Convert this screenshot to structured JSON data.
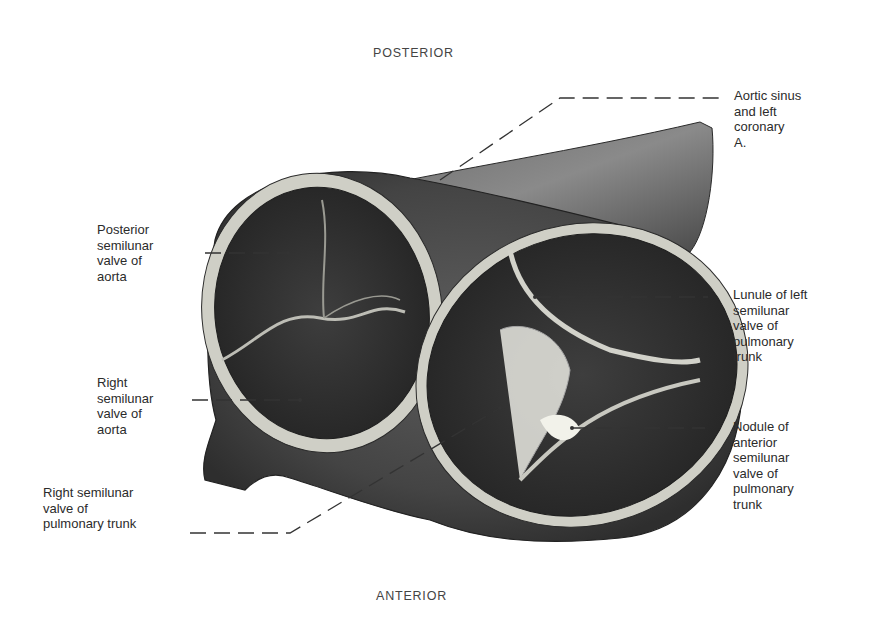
{
  "orientation": {
    "top": "POSTERIOR",
    "bottom": "ANTERIOR"
  },
  "labels": {
    "aortic_sinus": "Aortic sinus\nand left\ncoronary\nA.",
    "posterior_semilunar_aorta": "Posterior\nsemilunar\nvalve of\naorta",
    "right_semilunar_aorta": "Right\nsemilunar\nvalve of\naorta",
    "right_semilunar_pulmonary": "Right semilunar\nvalve of\npulmonary trunk",
    "lunule_left_semilunar_pulmonary": "Lunule of left\nsemilunar\nvalve of\npulmonary\ntrunk",
    "nodule_anterior_semilunar_pulmonary": "Nodule of\nanterior\nsemilunar\nvalve of\npulmonary\ntrunk"
  },
  "colors": {
    "tissue_dark": "#3a3a3a",
    "tissue_mid": "#5a5a5a",
    "rim_light": "#d8d8d0",
    "leader_line": "#3a3a3a"
  }
}
